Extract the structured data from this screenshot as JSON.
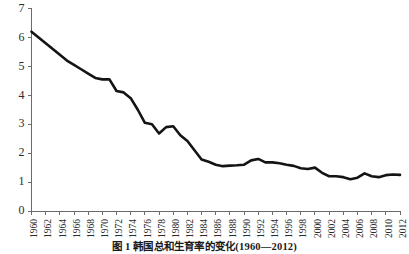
{
  "caption": "图 1  韩国总和生育率的变化(1960—2012)",
  "chart_data": {
    "type": "line",
    "title": "",
    "xlabel": "",
    "ylabel": "",
    "ylim": [
      0,
      7
    ],
    "xlim": [
      1960,
      2012
    ],
    "grid": false,
    "legend": "none",
    "line_color": "#141414",
    "axis_color": "#6b6b6b",
    "ytick_labels": [
      "7",
      "6",
      "5",
      "4",
      "3",
      "2",
      "1",
      "0"
    ],
    "ytick_values": [
      7,
      6,
      5,
      4,
      3,
      2,
      1,
      0
    ],
    "xtick_labels": [
      "1960",
      "1962",
      "1964",
      "1966",
      "1968",
      "1970",
      "1972",
      "1974",
      "1976",
      "1978",
      "1980",
      "1982",
      "1984",
      "1986",
      "1988",
      "1990",
      "1992",
      "1994",
      "1996",
      "1998",
      "2000",
      "2002",
      "2004",
      "2006",
      "2008",
      "2010",
      "2012"
    ],
    "xtick_values": [
      1960,
      1962,
      1964,
      1966,
      1968,
      1970,
      1972,
      1974,
      1976,
      1978,
      1980,
      1982,
      1984,
      1986,
      1988,
      1990,
      1992,
      1994,
      1996,
      1998,
      2000,
      2002,
      2004,
      2006,
      2008,
      2010,
      2012
    ],
    "x": [
      1960,
      1961,
      1962,
      1963,
      1964,
      1965,
      1966,
      1967,
      1968,
      1969,
      1970,
      1971,
      1972,
      1973,
      1974,
      1975,
      1976,
      1977,
      1978,
      1979,
      1980,
      1981,
      1982,
      1983,
      1984,
      1985,
      1986,
      1987,
      1988,
      1989,
      1990,
      1991,
      1992,
      1993,
      1994,
      1995,
      1996,
      1997,
      1998,
      1999,
      2000,
      2001,
      2002,
      2003,
      2004,
      2005,
      2006,
      2007,
      2008,
      2009,
      2010,
      2011,
      2012
    ],
    "values": [
      6.2,
      6.0,
      5.8,
      5.6,
      5.4,
      5.2,
      5.05,
      4.9,
      4.75,
      4.6,
      4.55,
      4.55,
      4.15,
      4.1,
      3.9,
      3.5,
      3.05,
      3.0,
      2.68,
      2.9,
      2.93,
      2.62,
      2.42,
      2.1,
      1.78,
      1.7,
      1.6,
      1.55,
      1.57,
      1.58,
      1.6,
      1.75,
      1.8,
      1.68,
      1.68,
      1.65,
      1.6,
      1.56,
      1.48,
      1.45,
      1.5,
      1.32,
      1.2,
      1.2,
      1.17,
      1.1,
      1.15,
      1.3,
      1.2,
      1.17,
      1.24,
      1.26,
      1.25
    ],
    "series_name": "韩国总和生育率"
  }
}
